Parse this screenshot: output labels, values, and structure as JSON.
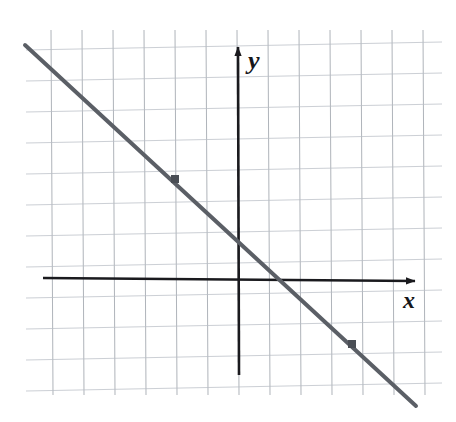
{
  "figure": {
    "kind": "coordinate-plane-line-graph",
    "width": 456,
    "height": 422,
    "background": "#ffffff"
  },
  "axes": {
    "x_label": "x",
    "y_label": "y",
    "origin_px": [
      238,
      278
    ],
    "x_axis": {
      "start_px": [
        43,
        278
      ],
      "end_px": [
        415,
        281
      ],
      "arrow": "right",
      "color": "#1a1a1e"
    },
    "y_axis": {
      "start_px": [
        239,
        375
      ],
      "end_px": [
        238,
        47
      ],
      "arrow": "up",
      "color": "#1a1a1e"
    },
    "x_label_px": [
      403,
      288
    ],
    "y_label_px": [
      248,
      48
    ]
  },
  "grid": {
    "color": "#9aa0a8",
    "minor_color": "#b9bec6",
    "line_width": 1,
    "cell_px": 31,
    "vertical_count": 13,
    "horizontal_count": 12,
    "v_first_x_px": 51,
    "h_first_y_px": 50,
    "v_top_y_px": 30,
    "v_bottom_y_px": 395,
    "h_left_x_px": 26,
    "h_right_x_px": 442,
    "skew_deg": -1.1
  },
  "chart_data": {
    "type": "line",
    "title": "",
    "xlabel": "x",
    "ylabel": "y",
    "grid": true,
    "legend": null,
    "axis_units": "unlabeled grid squares (1 square = 1 unit)",
    "xlim": [
      -6,
      6
    ],
    "ylim": [
      -3.2,
      7.4
    ],
    "series": [
      {
        "name": "line",
        "style": "solid",
        "color": "#5b5f66",
        "width_px": 4,
        "slope": -0.93,
        "y_intercept": 1.27,
        "endpoints_px": [
          [
            25,
            45
          ],
          [
            416,
            406
          ]
        ],
        "endpoints_units": [
          [
            -6.9,
            7.5
          ],
          [
            5.7,
            -4.1
          ]
        ]
      }
    ],
    "points": [
      {
        "name": "marked-point-1",
        "px": [
          175,
          179
        ],
        "units": [
          -2,
          3
        ],
        "marker": "square",
        "color": "#4a4e55",
        "size_px": 8
      },
      {
        "name": "marked-point-2",
        "px": [
          352,
          344
        ],
        "units": [
          3.7,
          -2.1
        ],
        "marker": "square",
        "color": "#4a4e55",
        "size_px": 8
      }
    ],
    "annotations": []
  }
}
